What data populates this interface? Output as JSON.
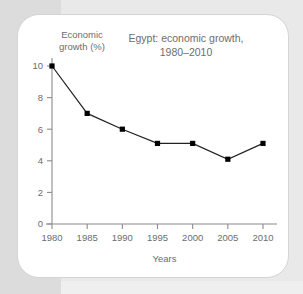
{
  "chart_data": {
    "type": "line",
    "title": "Egypt: economic growth,\n1980–2010",
    "xlabel": "Years",
    "ylabel": "Economic\ngrowth (%)",
    "x": [
      1980,
      1985,
      1990,
      1995,
      2000,
      2005,
      2010
    ],
    "categories": [
      "1980",
      "1985",
      "1990",
      "1995",
      "2000",
      "2005",
      "2010"
    ],
    "values": [
      10.0,
      7.0,
      6.0,
      5.1,
      5.1,
      4.1,
      5.1
    ],
    "series": [
      {
        "name": "Economic growth (%)",
        "values": [
          10.0,
          7.0,
          6.0,
          5.1,
          5.1,
          4.1,
          5.1
        ]
      }
    ],
    "xlim": [
      1980,
      2010
    ],
    "ylim": [
      0,
      10
    ],
    "yticks": [
      0,
      2,
      4,
      6,
      8,
      10
    ],
    "ytick_labels": [
      "0",
      "2",
      "4",
      "6",
      "8",
      "10"
    ],
    "xticks": [
      1980,
      1985,
      1990,
      1995,
      2000,
      2005,
      2010
    ],
    "xtick_labels": [
      "1980",
      "1985",
      "1990",
      "1995",
      "2000",
      "2005",
      "2010"
    ],
    "grid": false,
    "legend": "none",
    "marker": "square",
    "line_color": "#222222",
    "marker_color": "#000000",
    "axis_color": "#8c8c8c",
    "text_color": "#6d6d6d",
    "background": "#ffffff"
  }
}
